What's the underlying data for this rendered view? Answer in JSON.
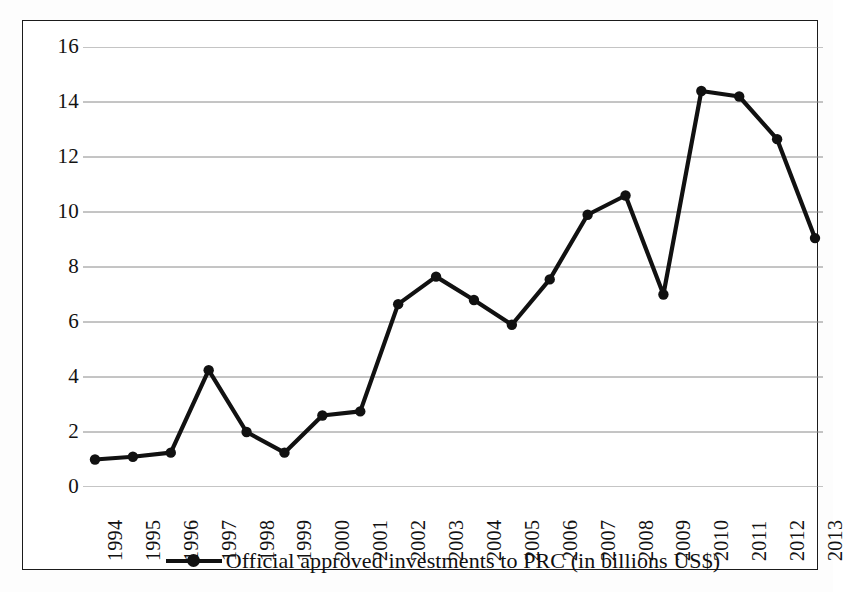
{
  "figure": {
    "background": "#ffffff",
    "frame_color": "#1b1b1b",
    "series_color": "#111111",
    "gridline_color": "#8a8a8a"
  },
  "legend": {
    "label": "Official approved investments to PRC (in billions US$)",
    "marker": "line-with-circle-marker",
    "position": "bottom-center"
  },
  "chart_data": {
    "type": "line",
    "title": "",
    "subtitle": "",
    "xlabel": "",
    "ylabel": "",
    "categories": [
      "1994",
      "1995",
      "1996",
      "1997",
      "1998",
      "1999",
      "2000",
      "2001",
      "2002",
      "2003",
      "2004",
      "2005",
      "2006",
      "2007",
      "2008",
      "2009",
      "2010",
      "2011",
      "2012",
      "2013"
    ],
    "series": [
      {
        "name": "Official approved investments to PRC (in billions US$)",
        "values": [
          1.0,
          1.1,
          1.25,
          4.25,
          2.0,
          1.25,
          2.6,
          2.75,
          6.65,
          7.65,
          6.8,
          5.9,
          7.55,
          9.9,
          10.6,
          7.0,
          14.4,
          14.2,
          12.65,
          9.05
        ],
        "color": "#111111",
        "marker": "circle",
        "line_width": 4
      }
    ],
    "ylim": [
      0,
      16
    ],
    "yticks": [
      0,
      2,
      4,
      6,
      8,
      10,
      12,
      14,
      16
    ],
    "ytick_labels": [
      "0",
      "2",
      "4",
      "6",
      "8",
      "10",
      "12",
      "14",
      "16"
    ],
    "xtick_labels": [
      "1994",
      "1995",
      "1996",
      "1997",
      "1998",
      "1999",
      "2000",
      "2001",
      "2002",
      "2003",
      "2004",
      "2005",
      "2006",
      "2007",
      "2008",
      "2009",
      "2010",
      "2011",
      "2012",
      "2013"
    ],
    "xtick_rotation": 90,
    "grid": true,
    "grid_axis": "y",
    "legend_position": "bottom-center"
  }
}
